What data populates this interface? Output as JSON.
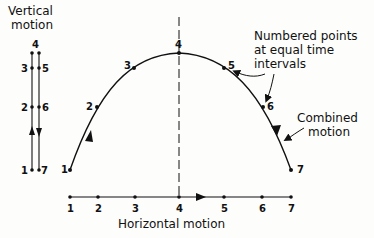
{
  "labels": {
    "vertical_motion_line1": "Vertical",
    "vertical_motion_line2": "motion",
    "numbered_points_line1": "Numbered points",
    "numbered_points_line2": "at equal time",
    "numbered_points_line3": "intervals",
    "combined_motion_line1": "Combined",
    "combined_motion_line2": "motion",
    "horizontal_motion": "Horizontal motion"
  },
  "trajectory_points": [
    {
      "label": "1",
      "x": 70,
      "y": 170
    },
    {
      "label": "2",
      "x": 97,
      "y": 107
    },
    {
      "label": "3",
      "x": 134,
      "y": 68
    },
    {
      "label": "4",
      "x": 179,
      "y": 53
    },
    {
      "label": "5",
      "x": 224,
      "y": 68
    },
    {
      "label": "6",
      "x": 263,
      "y": 107
    },
    {
      "label": "7",
      "x": 291,
      "y": 170
    }
  ],
  "vertical_points": {
    "up_labels": [
      "1",
      "2",
      "3",
      "4"
    ],
    "down_labels": [
      "5",
      "6",
      "7"
    ]
  },
  "horizontal_points": [
    "1",
    "2",
    "3",
    "4",
    "5",
    "6",
    "7"
  ],
  "colors": {
    "ink": "#111111",
    "background": "#fdfdfc"
  }
}
